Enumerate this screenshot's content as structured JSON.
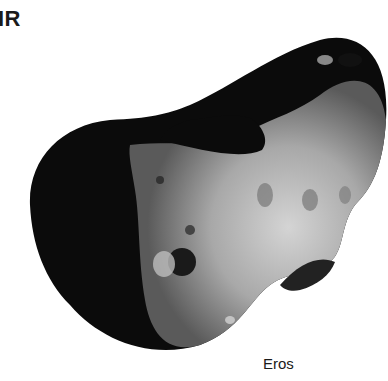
{
  "header": {
    "text": "IR"
  },
  "image": {
    "subject": "asteroid",
    "caption": "Eros"
  },
  "colors": {
    "background": "#ffffff",
    "shadow": "#0b0b0b",
    "surface_light": "#c8c8c8",
    "surface_mid": "#8a8a8a"
  }
}
